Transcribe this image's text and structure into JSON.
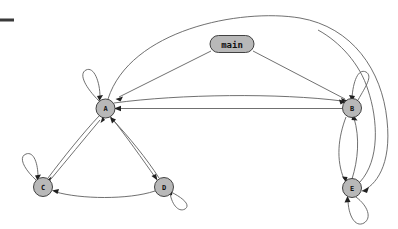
{
  "diagram": {
    "kind": "call-graph",
    "title": "",
    "background_color": "#ffffff",
    "node_fill_color": "#b8b8b8",
    "node_stroke_color": "#303030",
    "edge_color": "#606060",
    "arrowhead_color": "#202020",
    "corner_tick": {
      "name": "crop-mark",
      "color": "#3a3a3a",
      "x": 0,
      "y": 18,
      "width": 14,
      "height": 3
    },
    "nodes": [
      {
        "id": "main",
        "label": "main",
        "shape": "stadium",
        "cx": 232,
        "cy": 44,
        "rx": 22,
        "ry": 8.5
      },
      {
        "id": "A",
        "label": "A",
        "shape": "circle",
        "cx": 105.5,
        "cy": 108.5,
        "r": 9.5
      },
      {
        "id": "B",
        "label": "B",
        "shape": "circle",
        "cx": 352,
        "cy": 108,
        "r": 9.5
      },
      {
        "id": "C",
        "label": "C",
        "shape": "circle",
        "cx": 43,
        "cy": 187,
        "r": 9.5
      },
      {
        "id": "D",
        "label": "D",
        "shape": "circle",
        "cx": 164,
        "cy": 187,
        "r": 9.5
      },
      {
        "id": "E",
        "label": "E",
        "shape": "circle",
        "cx": 352,
        "cy": 188,
        "r": 9.5
      }
    ],
    "edges": [
      {
        "from": "main",
        "to": "A",
        "style": "straight"
      },
      {
        "from": "main",
        "to": "B",
        "style": "straight"
      },
      {
        "from": "A",
        "to": "B",
        "style": "straight"
      },
      {
        "from": "B",
        "to": "A",
        "style": "curved"
      },
      {
        "from": "A",
        "to": "C",
        "style": "curved"
      },
      {
        "from": "C",
        "to": "A",
        "style": "curved"
      },
      {
        "from": "A",
        "to": "D",
        "style": "curved"
      },
      {
        "from": "D",
        "to": "A",
        "style": "curved"
      },
      {
        "from": "D",
        "to": "C",
        "style": "curved"
      },
      {
        "from": "B",
        "to": "E",
        "style": "curved"
      },
      {
        "from": "E",
        "to": "B",
        "style": "curved"
      },
      {
        "from": "A",
        "to": "E",
        "style": "arc-over-top"
      },
      {
        "from": "E",
        "to": "A",
        "style": "arc-over-top"
      },
      {
        "from": "A",
        "to": "A",
        "style": "self-loop"
      },
      {
        "from": "B",
        "to": "B",
        "style": "self-loop"
      },
      {
        "from": "C",
        "to": "C",
        "style": "self-loop"
      },
      {
        "from": "D",
        "to": "D",
        "style": "self-loop"
      },
      {
        "from": "E",
        "to": "E",
        "style": "self-loop"
      }
    ]
  }
}
